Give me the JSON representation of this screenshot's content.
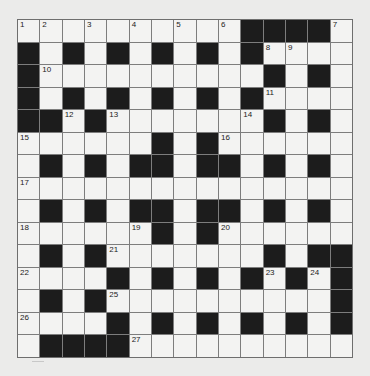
{
  "puzzle": {
    "type": "crossword",
    "rows": 15,
    "cols": 15,
    "colors": {
      "background": "#ebebea",
      "white_cell": "#f3f3f2",
      "black_cell": "#1c1c1c",
      "grid_line": "#7d7d7d"
    },
    "layout": [
      "..........####.",
      "#.#.#.#.#.#....",
      "#..........#.#.",
      "#.#.#.#.#.#....",
      "##.#.......#.#.",
      "......#.#......",
      ".#.#.##.##.#.#.",
      "...............",
      ".#.#.##.##.#.#.",
      "......#.#......",
      ".#.#.......#.##",
      "....#.#.#.#.#.#",
      ".#.#..........#",
      "....#.#.#.#.#.#",
      ".####.........."
    ],
    "numbers": [
      {
        "n": "1",
        "r": 0,
        "c": 0
      },
      {
        "n": "2",
        "r": 0,
        "c": 1
      },
      {
        "n": "3",
        "r": 0,
        "c": 3
      },
      {
        "n": "4",
        "r": 0,
        "c": 5
      },
      {
        "n": "5",
        "r": 0,
        "c": 7
      },
      {
        "n": "6",
        "r": 0,
        "c": 9
      },
      {
        "n": "7",
        "r": 0,
        "c": 14
      },
      {
        "n": "8",
        "r": 1,
        "c": 11
      },
      {
        "n": "9",
        "r": 1,
        "c": 12
      },
      {
        "n": "10",
        "r": 2,
        "c": 1
      },
      {
        "n": "11",
        "r": 3,
        "c": 11
      },
      {
        "n": "12",
        "r": 4,
        "c": 2
      },
      {
        "n": "13",
        "r": 4,
        "c": 4
      },
      {
        "n": "14",
        "r": 4,
        "c": 10
      },
      {
        "n": "15",
        "r": 5,
        "c": 0
      },
      {
        "n": "16",
        "r": 5,
        "c": 9
      },
      {
        "n": "17",
        "r": 7,
        "c": 0
      },
      {
        "n": "18",
        "r": 9,
        "c": 0
      },
      {
        "n": "19",
        "r": 9,
        "c": 5
      },
      {
        "n": "20",
        "r": 9,
        "c": 9
      },
      {
        "n": "21",
        "r": 10,
        "c": 4
      },
      {
        "n": "22",
        "r": 11,
        "c": 0
      },
      {
        "n": "23",
        "r": 11,
        "c": 11
      },
      {
        "n": "24",
        "r": 11,
        "c": 13
      },
      {
        "n": "25",
        "r": 12,
        "c": 4
      },
      {
        "n": "26",
        "r": 13,
        "c": 0
      },
      {
        "n": "27",
        "r": 14,
        "c": 5
      }
    ]
  }
}
